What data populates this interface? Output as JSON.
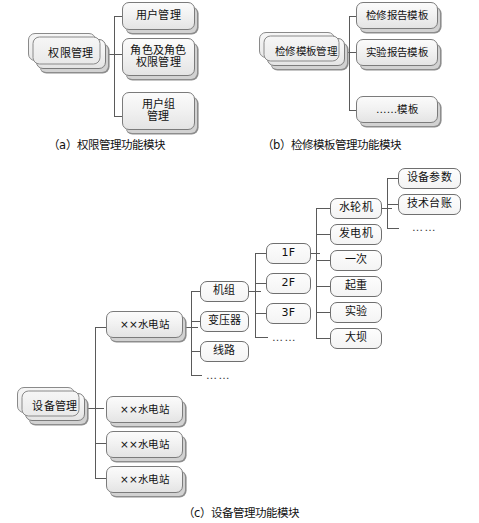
{
  "figure": {
    "sections": [
      {
        "id": "a",
        "caption": "（a）权限管理功能模块",
        "root": "权限管理",
        "children": [
          "用户管理",
          "角色及角色\n权限管理",
          "用户组\n管理"
        ]
      },
      {
        "id": "b",
        "caption": "（b）检修模板管理功能模块",
        "root": "检修模板管理",
        "children": [
          "检修报告模板",
          "实验报告模板",
          "……模板"
        ]
      },
      {
        "id": "c",
        "caption": "（c）设备管理功能模块",
        "root": "设备管理",
        "stations": [
          "××水电站",
          "××水电站",
          "××水电站",
          "××水电站"
        ],
        "station_children": [
          "机组",
          "变压器",
          "线路"
        ],
        "station_children_more": "……",
        "unit_children": [
          "1F",
          "2F",
          "3F"
        ],
        "unit_children_more": "……",
        "floor_children": [
          "水轮机",
          "发电机",
          "一次",
          "起重",
          "实验",
          "大坝"
        ],
        "device_children": [
          "设备参数",
          "技术台账"
        ],
        "device_children_more": "……"
      }
    ]
  },
  "nodes": {
    "a_root": "权限管理",
    "a_c1": "用户管理",
    "a_c2_l1": "角色及角色",
    "a_c2_l2": "权限管理",
    "a_c3_l1": "用户组",
    "a_c3_l2": "管理",
    "b_root": "检修模板管理",
    "b_c1": "检修报告模板",
    "b_c2": "实验报告模板",
    "b_c3": "……模板",
    "c_root": "设备管理",
    "c_st1": "××水电站",
    "c_st2": "××水电站",
    "c_st3": "××水电站",
    "c_st4": "××水电站",
    "c_jizu": "机组",
    "c_bianyaqi": "变压器",
    "c_xianlu": "线路",
    "c_station_more": "……",
    "c_1f": "1F",
    "c_2f": "2F",
    "c_3f": "3F",
    "c_unit_more": "……",
    "c_shuilunji": "水轮机",
    "c_fadianji": "发电机",
    "c_yici": "一次",
    "c_zhongqi": "起重",
    "c_shiyan": "实验",
    "c_daba": "大坝",
    "c_shebeicanshu": "设备参数",
    "c_jishutaizhang": "技术台账",
    "c_device_more": "……"
  },
  "captions": {
    "a": "（a）权限管理功能模块",
    "b": "（b）检修模板管理功能模块",
    "c": "（c）设备管理功能模块"
  },
  "colors": {
    "box_border": "#7b7b7b",
    "box_fill_top": "#fbfbfb",
    "box_fill_bottom": "#e4e4e4",
    "connector": "#5a5a5a",
    "text": "#111111",
    "background": "#ffffff"
  }
}
